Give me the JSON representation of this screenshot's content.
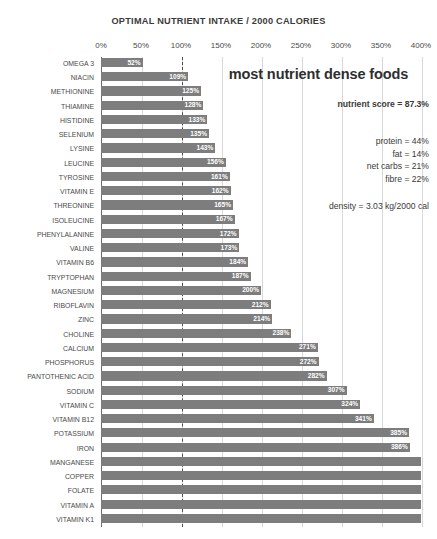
{
  "chart_data": {
    "type": "bar",
    "orientation": "horizontal",
    "title": "OPTIMAL NUTRIENT INTAKE / 2000 CALORIES",
    "xlabel": "",
    "ylabel": "",
    "xlim": [
      0,
      400
    ],
    "xticks": [
      "0%",
      "50%",
      "100%",
      "150%",
      "200%",
      "250%",
      "300%",
      "350%",
      "400%"
    ],
    "xtick_values": [
      0,
      50,
      100,
      150,
      200,
      250,
      300,
      350,
      400
    ],
    "grid": true,
    "reference_line": 100,
    "legend": "none",
    "bar_color": "#7d7d7d",
    "categories": [
      "OMEGA 3",
      "NIACIN",
      "METHIONINE",
      "THIAMINE",
      "HISTIDINE",
      "SELENIUM",
      "LYSINE",
      "LEUCINE",
      "TYROSINE",
      "VITAMIN E",
      "THREONINE",
      "ISOLEUCINE",
      "PHENYLALANINE",
      "VALINE",
      "VITAMIN B6",
      "TRYPTOPHAN",
      "MAGNESIUM",
      "RIBOFLAVIN",
      "ZINC",
      "CHOLINE",
      "CALCIUM",
      "PHOSPHORUS",
      "PANTOTHENIC ACID",
      "SODIUM",
      "VITAMIN C",
      "VITAMIN B12",
      "POTASSIUM",
      "IRON",
      "MANGANESE",
      "COPPER",
      "FOLATE",
      "VITAMIN A",
      "VITAMIN K1"
    ],
    "values": [
      52,
      109,
      125,
      128,
      133,
      135,
      143,
      156,
      161,
      162,
      165,
      167,
      172,
      173,
      184,
      187,
      200,
      212,
      214,
      238,
      271,
      272,
      282,
      307,
      324,
      341,
      385,
      386,
      420,
      420,
      420,
      420,
      420
    ],
    "value_labels": [
      "52%",
      "109%",
      "125%",
      "128%",
      "133%",
      "135%",
      "143%",
      "156%",
      "161%",
      "162%",
      "165%",
      "167%",
      "172%",
      "173%",
      "184%",
      "187%",
      "200%",
      "212%",
      "214%",
      "238%",
      "271%",
      "272%",
      "282%",
      "307%",
      "324%",
      "341%",
      "385%",
      "386%",
      "",
      "",
      "",
      "",
      ""
    ]
  },
  "annotations": {
    "headline": "most nutrient dense foods",
    "score": "nutrient score = 87.3%",
    "macros": [
      "protein = 44%",
      "fat = 14%",
      "net carbs = 21%",
      "fibre = 22%"
    ],
    "density": "density = 3.03 kg/2000 cal"
  }
}
